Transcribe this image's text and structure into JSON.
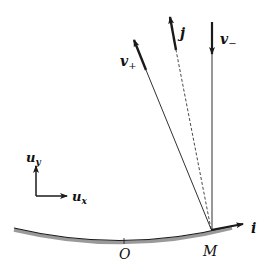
{
  "diagram": {
    "type": "vector-diagram",
    "colors": {
      "stroke": "#1a1a1a",
      "surface_shadow": "#9a9a9a",
      "dashed": "#333333"
    },
    "labels": {
      "v_plus": "v",
      "v_plus_sub": "+",
      "v_minus": "v",
      "v_minus_sub": "−",
      "j": "j",
      "i": "i",
      "u_y": "u",
      "u_y_sub": "y",
      "u_x": "u",
      "u_x_sub": "x",
      "O": "O",
      "M": "M"
    },
    "points": {
      "M": [
        211,
        229
      ],
      "O": [
        124,
        242
      ]
    },
    "vectors": [
      {
        "name": "v_plus",
        "from": [
          211,
          229
        ],
        "to": [
          133,
          38
        ],
        "style": "solid"
      },
      {
        "name": "v_minus",
        "from": [
          212,
          22
        ],
        "to": [
          212,
          229
        ],
        "style": "solid"
      },
      {
        "name": "j",
        "from": [
          211,
          229
        ],
        "to": [
          169,
          15
        ],
        "style": "dashed"
      },
      {
        "name": "i",
        "from": [
          211,
          229
        ],
        "to": [
          245,
          224
        ],
        "style": "solid"
      },
      {
        "name": "u_y",
        "from": [
          36,
          196
        ],
        "to": [
          36,
          165
        ],
        "style": "solid"
      },
      {
        "name": "u_x",
        "from": [
          36,
          196
        ],
        "to": [
          68,
          196
        ],
        "style": "solid"
      }
    ]
  }
}
